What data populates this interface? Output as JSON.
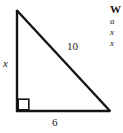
{
  "figure": {
    "type": "right-triangle-diagram",
    "vertices": {
      "apex": [
        16,
        10
      ],
      "right_angle": [
        16,
        111
      ],
      "base_right": [
        110,
        111
      ]
    },
    "right_angle_marker": {
      "x": 17,
      "y": 98,
      "size": 12
    },
    "stroke_color": "#141414",
    "background_color": "#ffffff",
    "labels": {
      "vertical_leg": "x",
      "hypotenuse": "10",
      "base": "6"
    }
  },
  "side_text": {
    "heading": "W",
    "lines": [
      "a",
      "x",
      "x"
    ]
  }
}
